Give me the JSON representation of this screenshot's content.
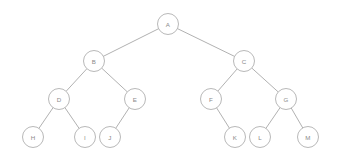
{
  "diagram": {
    "type": "binary-tree",
    "background_color": "#ffffff",
    "node_fill_color": "#ffffff",
    "node_stroke_color": "#b0b0b0",
    "edge_stroke_color": "#a8a8a8",
    "label_color": "#8a8a8a",
    "node_radius": 10.5,
    "canvas": {
      "width": 337,
      "height": 162
    },
    "nodes": [
      {
        "id": "A",
        "label": "A",
        "x": 168,
        "y": 24,
        "depth": 0
      },
      {
        "id": "B",
        "label": "B",
        "x": 94,
        "y": 61,
        "depth": 1
      },
      {
        "id": "C",
        "label": "C",
        "x": 244,
        "y": 61,
        "depth": 1
      },
      {
        "id": "D",
        "label": "D",
        "x": 59,
        "y": 99,
        "depth": 2
      },
      {
        "id": "E",
        "label": "E",
        "x": 135,
        "y": 99,
        "depth": 2
      },
      {
        "id": "F",
        "label": "F",
        "x": 211,
        "y": 99,
        "depth": 2
      },
      {
        "id": "G",
        "label": "G",
        "x": 286,
        "y": 99,
        "depth": 2
      },
      {
        "id": "H",
        "label": "H",
        "x": 33,
        "y": 137,
        "depth": 3
      },
      {
        "id": "I",
        "label": "I",
        "x": 85,
        "y": 137,
        "depth": 3
      },
      {
        "id": "J",
        "label": "J",
        "x": 110,
        "y": 137,
        "depth": 3
      },
      {
        "id": "K",
        "label": "K",
        "x": 235,
        "y": 137,
        "depth": 3
      },
      {
        "id": "L",
        "label": "L",
        "x": 260,
        "y": 137,
        "depth": 3
      },
      {
        "id": "M",
        "label": "M",
        "x": 308,
        "y": 137,
        "depth": 3
      }
    ],
    "edges": [
      {
        "from": "A",
        "to": "B",
        "side": "left"
      },
      {
        "from": "A",
        "to": "C",
        "side": "right"
      },
      {
        "from": "B",
        "to": "D",
        "side": "left"
      },
      {
        "from": "B",
        "to": "E",
        "side": "right"
      },
      {
        "from": "D",
        "to": "H",
        "side": "left"
      },
      {
        "from": "D",
        "to": "I",
        "side": "right"
      },
      {
        "from": "E",
        "to": "J",
        "side": "left"
      },
      {
        "from": "C",
        "to": "F",
        "side": "left"
      },
      {
        "from": "C",
        "to": "G",
        "side": "right"
      },
      {
        "from": "F",
        "to": "K",
        "side": "right"
      },
      {
        "from": "G",
        "to": "L",
        "side": "left"
      },
      {
        "from": "G",
        "to": "M",
        "side": "right"
      }
    ]
  }
}
